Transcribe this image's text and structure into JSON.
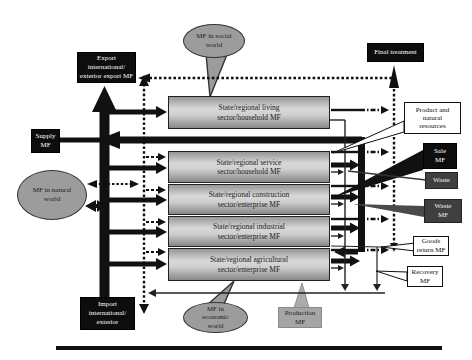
{
  "diagram": {
    "bubbles": {
      "social": "MF in social\nworld",
      "natural": "MF in natural\nworld",
      "economic": "MF in\neconomic\nworld"
    },
    "flow_boxes": {
      "export": "Export\ninternational/\nexterior export MF",
      "final_treatment": "Final treatment",
      "supply": "Supply\nMF",
      "import": "Import\ninternational/\nexterior"
    },
    "sectors": [
      "State/regional living\nsector/household MF",
      "State/regional service\nsector/household MF",
      "State/regional construction\nsector/enterprise MF",
      "State/regional industrial\nsector/enterprise MF",
      "State/regional agricultural\nsector/enterprise MF"
    ],
    "labels": {
      "product_resources": "Product and\nnatural\nresources",
      "sale": "Sale\nMF",
      "waste": "Waste",
      "waste_mf": "Waste\nMF",
      "goods_return": "Goods\nreturn MF",
      "recovery": "Recovery\nMF",
      "production": "Production\nMF"
    },
    "colors": {
      "black_box": "#0d0d0d",
      "dark_box": "#3f3f3f",
      "bubble_gray": "#9c9c9c",
      "production_gray": "#a5a5a5"
    }
  }
}
